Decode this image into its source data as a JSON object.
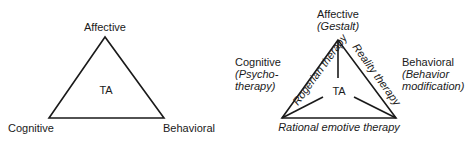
{
  "left_diagram": {
    "top": "Affective",
    "left": "Cognitive",
    "right": "Behavioral",
    "center": "TA"
  },
  "right_diagram": {
    "top": {
      "label": "Affective",
      "therapy": "(Gestalt)"
    },
    "left": {
      "label": "Cognitive",
      "therapy_line1": "(Psycho-",
      "therapy_line2": "therapy)"
    },
    "right": {
      "label": "Behavioral",
      "therapy_line1": "(Behavior",
      "therapy_line2": "modification)"
    },
    "center": "TA",
    "edge_left": "Rogerian therapy",
    "edge_right": "Reality therapy",
    "edge_bottom": "Rational emotive therapy"
  },
  "colors": {
    "line": "#1a1a1a",
    "background": "#ffffff"
  }
}
